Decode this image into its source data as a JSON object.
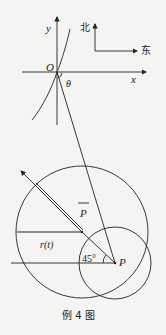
{
  "figure": {
    "caption": "例 4 图",
    "labels": {
      "y_axis": "y",
      "x_axis": "x",
      "origin": "O",
      "angle": "θ",
      "north": "北",
      "east": "东",
      "p_bar": "P",
      "radius": "r(t)",
      "angle_45": "45°",
      "point_p": "P"
    },
    "colors": {
      "stroke": "#222222",
      "background": "#f4f4f2"
    }
  }
}
